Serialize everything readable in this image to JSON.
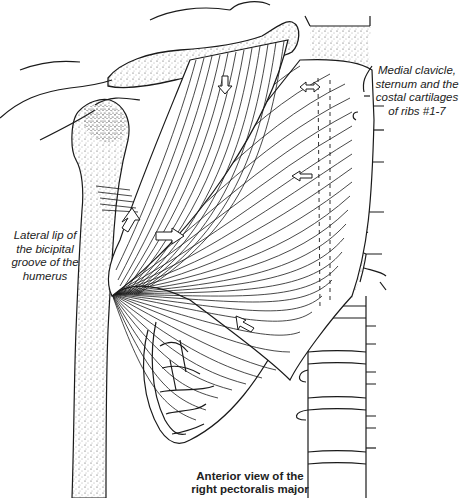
{
  "figure": {
    "labels": {
      "origin": {
        "lines": [
          "Medial clavicle,",
          "sternum and the",
          "costal cartilages",
          "of ribs #1-7"
        ]
      },
      "insertion": {
        "lines": [
          "Lateral lip of",
          "the bicipital",
          "groove of the",
          "humerus"
        ]
      }
    },
    "caption": {
      "lines": [
        "Anterior view of the",
        "right pectoralis major"
      ]
    },
    "arrows": [
      {
        "name": "clavicular-fibers-arrow",
        "direction": "down"
      },
      {
        "name": "upper-sternal-fibers-arrow",
        "direction": "left-right"
      },
      {
        "name": "mid-sternal-fibers-arrow",
        "direction": "left"
      },
      {
        "name": "insertion-up-arrow",
        "direction": "up"
      },
      {
        "name": "insertion-right-arrow",
        "direction": "right"
      },
      {
        "name": "lower-fibers-arrow",
        "direction": "up-left"
      }
    ],
    "colors": {
      "ink": "#1a1a1a",
      "paper": "#ffffff",
      "label_text": "#222222"
    }
  }
}
